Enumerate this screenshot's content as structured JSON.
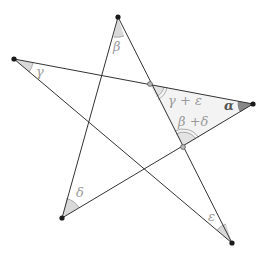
{
  "diagram": {
    "type": "pentagram-angle-sum",
    "colors": {
      "line": "#333333",
      "point": "#1a1a1a",
      "angle_fill": "#d9d9d9",
      "alpha_fill": "#888888",
      "triangle_fill": "#f3f3f3",
      "label": "#9a9a9a",
      "alpha_label": "#555555",
      "intersection_point": "#9a9a9a"
    },
    "points": {
      "top": [
        118,
        17
      ],
      "left": [
        14,
        59
      ],
      "right": [
        253,
        104
      ],
      "bottom_left": [
        62,
        218
      ],
      "bottom_right": [
        232,
        243
      ],
      "p_upper": [
        150,
        84
      ],
      "p_lower": [
        183,
        147
      ]
    },
    "labels": {
      "alpha": "α",
      "beta": "β",
      "gamma": "γ",
      "delta": "δ",
      "epsilon": "ε",
      "gamma_plus_epsilon": "γ + ε",
      "beta_plus_delta": "β +δ"
    }
  }
}
